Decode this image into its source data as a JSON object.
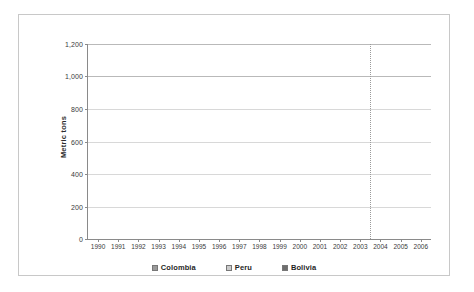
{
  "chart_data": {
    "type": "bar",
    "subtype": "stacked-bar",
    "title": "",
    "xlabel": "",
    "ylabel": "Metric tons",
    "ylim": [
      0,
      1200
    ],
    "yticks": [
      0,
      200,
      400,
      600,
      800,
      1000,
      1200
    ],
    "ytick_labels": [
      "0",
      "200",
      "400",
      "600",
      "800",
      "1,000",
      "1,200"
    ],
    "grid": true,
    "legend_position": "bottom",
    "categories": [
      "1990",
      "1991",
      "1992",
      "1993",
      "1994",
      "1995",
      "1996",
      "1997",
      "1998",
      "1999",
      "2000",
      "2001",
      "2002",
      "2003",
      "2004",
      "2005",
      "2006"
    ],
    "series": [
      {
        "name": "Colombia",
        "color": "#9a9a9a",
        "values": [
          92,
          88,
          88,
          119,
          201,
          230,
          302,
          348,
          435,
          680,
          695,
          617,
          580,
          550,
          640,
          640,
          610
        ]
      },
      {
        "name": "Peru",
        "color": "#cbcbcb",
        "values": [
          492,
          530,
          552,
          410,
          435,
          460,
          435,
          322,
          240,
          160,
          135,
          155,
          155,
          230,
          250,
          255,
          275
        ]
      },
      {
        "name": "Bolivia",
        "color": "#6e6e6e",
        "values": [
          189,
          213,
          223,
          240,
          255,
          240,
          215,
          200,
          145,
          80,
          43,
          43,
          60,
          70,
          110,
          95,
          95
        ]
      }
    ],
    "totals": [
      773,
      831,
      863,
      769,
      891,
      930,
      952,
      870,
      820,
      920,
      873,
      815,
      795,
      850,
      1000,
      990,
      980
    ],
    "annotations": [
      {
        "type": "vertical-reference-line",
        "style": "dotted",
        "between": [
          "2003",
          "2004"
        ],
        "color": "#9a9a9a"
      }
    ]
  },
  "legend": {
    "items": [
      {
        "label": "Colombia",
        "color": "#9a9a9a"
      },
      {
        "label": "Peru",
        "color": "#cbcbcb"
      },
      {
        "label": "Bolivia",
        "color": "#6e6e6e"
      }
    ]
  }
}
